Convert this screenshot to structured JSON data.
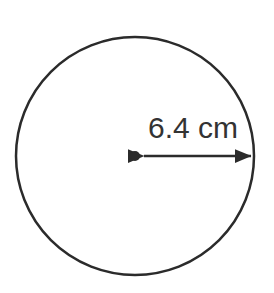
{
  "figure": {
    "kind": "geometry-diagram",
    "shape_name": "circle",
    "canvas": {
      "width": 274,
      "height": 293,
      "background_color": "#ffffff"
    },
    "circle": {
      "center_x": 135,
      "center_y": 156,
      "radius": 119,
      "stroke_color": "#2b2b2b",
      "stroke_width": 2.5,
      "fill": "none"
    },
    "center_dot": {
      "center_x": 135,
      "center_y": 156,
      "radius": 5,
      "color": "#2b2b2b"
    },
    "radius_arrow": {
      "orientation": "horizontal",
      "double_headed": true,
      "x_start": 144,
      "x_end": 252,
      "y": 156,
      "color": "#2b2b2b",
      "stroke_width": 2.5
    },
    "radius_label": {
      "text": "6.4 cm",
      "value": 6.4,
      "unit": "cm",
      "measures": "radius",
      "x": 148,
      "y": 138,
      "font_size": 30,
      "color": "#333333"
    }
  }
}
